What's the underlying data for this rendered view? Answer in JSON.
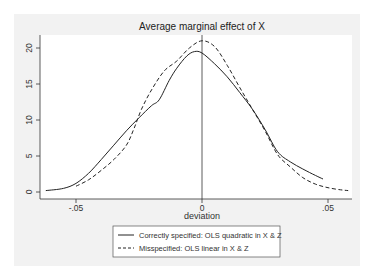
{
  "chart_data": {
    "type": "line",
    "title": "Average marginal effect of X",
    "xlabel": "deviation",
    "ylabel": "",
    "xlim": [
      -0.065,
      0.058
    ],
    "ylim": [
      0,
      22
    ],
    "x_ticks": [
      -0.05,
      0,
      0.05
    ],
    "x_tick_labels": [
      "-.05",
      "0",
      ".05"
    ],
    "y_ticks": [
      0,
      5,
      10,
      15,
      20
    ],
    "y_tick_labels": [
      "0",
      "5",
      "10",
      "15",
      "20"
    ],
    "grid": false,
    "reference_line": {
      "x": 0
    },
    "legend_position": "bottom",
    "series": [
      {
        "name": "Correctly specified: OLS quadratic in X & Z",
        "style": "solid",
        "x": [
          -0.062,
          -0.055,
          -0.05,
          -0.045,
          -0.04,
          -0.035,
          -0.03,
          -0.025,
          -0.02,
          -0.017,
          -0.013,
          -0.01,
          -0.006,
          -0.003,
          0,
          0.005,
          0.01,
          0.015,
          0.02,
          0.025,
          0.03,
          0.035,
          0.04,
          0.045,
          0.048
        ],
        "y": [
          0.2,
          0.5,
          1.2,
          2.6,
          4.5,
          6.5,
          8.5,
          10.3,
          12.0,
          12.8,
          15.5,
          17.2,
          18.9,
          19.5,
          19.3,
          17.8,
          16.0,
          13.8,
          11.5,
          8.7,
          5.6,
          4.2,
          3.2,
          2.3,
          1.8
        ]
      },
      {
        "name": "Misspecified: OLS linear in X & Z",
        "style": "dashed",
        "x": [
          -0.05,
          -0.045,
          -0.04,
          -0.035,
          -0.03,
          -0.027,
          -0.024,
          -0.02,
          -0.015,
          -0.01,
          -0.005,
          0,
          0.005,
          0.01,
          0.015,
          0.02,
          0.025,
          0.03,
          0.035,
          0.04,
          0.045,
          0.05,
          0.055,
          0.058
        ],
        "y": [
          0.8,
          1.7,
          3.0,
          4.5,
          6.5,
          8.8,
          11.5,
          14.2,
          16.8,
          18.2,
          20.0,
          21.0,
          20.2,
          17.6,
          14.5,
          11.5,
          8.5,
          5.2,
          3.5,
          2.0,
          1.1,
          0.6,
          0.3,
          0.2
        ]
      }
    ]
  },
  "legend": {
    "items": [
      {
        "label": "Correctly specified: OLS quadratic in X & Z",
        "style": "solid"
      },
      {
        "label": "Misspecified: OLS linear in X & Z",
        "style": "dashed"
      }
    ]
  },
  "colors": {
    "outer_background": "#f2f2f2",
    "plot_background": "#ffffff",
    "line": "#222222"
  }
}
